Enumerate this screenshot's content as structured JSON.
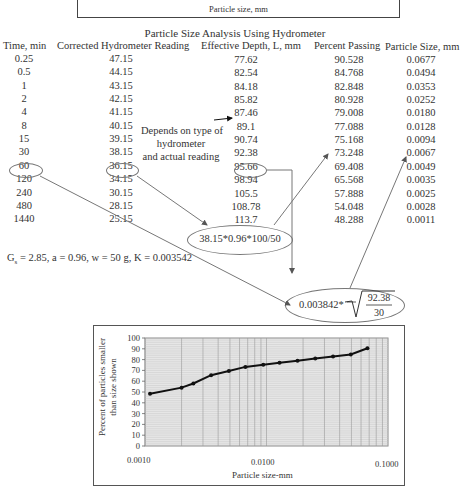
{
  "top_box": {
    "axis_label": "Particle size, mm"
  },
  "table": {
    "title": "Particle Size Analysis Using Hydrometer",
    "columns": [
      "Time, min",
      "Corrected Hydrometer Reading",
      "Effective Depth, L, mm",
      "Percent Passing",
      "Particle Size, mm"
    ],
    "rows": [
      [
        "0.25",
        "47.15",
        "77.62",
        "90.528",
        "0.0677"
      ],
      [
        "0.5",
        "44.15",
        "82.54",
        "84.768",
        "0.0494"
      ],
      [
        "1",
        "43.15",
        "84.18",
        "82.848",
        "0.0353"
      ],
      [
        "2",
        "42.15",
        "85.82",
        "80.928",
        "0.0252"
      ],
      [
        "4",
        "41.15",
        "87.46",
        "79.008",
        "0.0180"
      ],
      [
        "8",
        "40.15",
        "89.1",
        "77.088",
        "0.0128"
      ],
      [
        "15",
        "39.15",
        "90.74",
        "75.168",
        "0.0094"
      ],
      [
        "30",
        "38.15",
        "92.38",
        "73.248",
        "0.0067"
      ],
      [
        "60",
        "36.15",
        "95.66",
        "69.408",
        "0.0049"
      ],
      [
        "120",
        "34.15",
        "98.94",
        "65.568",
        "0.0035"
      ],
      [
        "240",
        "30.15",
        "105.5",
        "57.888",
        "0.0025"
      ],
      [
        "480",
        "28.15",
        "108.78",
        "54.048",
        "0.0028"
      ],
      [
        "1440",
        "25.15",
        "113.7",
        "48.288",
        "0.0011"
      ]
    ]
  },
  "annotation": {
    "depends_note": [
      "Depends on type of",
      "hydrometer",
      "and actual reading"
    ],
    "percent_formula": "38.15*0.96*100/50",
    "size_formula_prefix": "0.003842*",
    "size_formula_numerator": "92.38",
    "size_formula_denominator": "30"
  },
  "params": {
    "gs_symbol": "G",
    "gs_sub": "s",
    "rest": " = 2.85, a = 0.96, w = 50 g, K = 0.003542"
  },
  "chart_data": {
    "type": "line",
    "title": "",
    "xlabel": "Particle size-mm",
    "ylabel": "Percent of particles smaller than size shown",
    "ylabel_lines": [
      "Percent of particles smaller",
      "than size shown"
    ],
    "xscale": "log",
    "xlim": [
      0.001,
      0.1
    ],
    "ylim": [
      0,
      100
    ],
    "x_tick_labels": [
      "0.0010",
      "0.0100",
      "0.1000"
    ],
    "y_tick_labels": [
      "0",
      "10",
      "20",
      "30",
      "40",
      "50",
      "60",
      "70",
      "80",
      "90",
      "100"
    ],
    "grid": true,
    "legend": null,
    "series": [
      {
        "name": "Percent passing",
        "x": [
          0.0011,
          0.002,
          0.0025,
          0.0035,
          0.0049,
          0.0067,
          0.0094,
          0.0128,
          0.018,
          0.0252,
          0.0353,
          0.0494,
          0.0677
        ],
        "y": [
          48.288,
          54.048,
          57.888,
          65.568,
          69.408,
          73.248,
          75.168,
          77.088,
          79.008,
          80.928,
          82.848,
          84.768,
          90.528
        ]
      }
    ]
  },
  "colors": {
    "text": "#333333",
    "line": "#111111",
    "grid": "#bbbbbb",
    "plot_bg": "#e6e6e6",
    "connector": "#777777"
  }
}
